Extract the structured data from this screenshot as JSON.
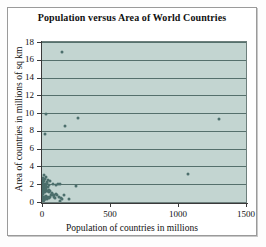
{
  "chart_data": {
    "type": "scatter",
    "title": "Population versus Area of World Countries",
    "xlabel": "Population of countries in millions",
    "ylabel": "Area of countries in millions of sq km",
    "xlim": [
      0,
      1500
    ],
    "ylim": [
      0,
      18
    ],
    "xticks": [
      0,
      500,
      1000,
      1500
    ],
    "yticks": [
      0,
      2,
      4,
      6,
      8,
      10,
      12,
      14,
      16,
      18
    ],
    "xtick_labels": [
      "0",
      "500",
      "1000",
      "1500"
    ],
    "ytick_labels": [
      "0",
      "2",
      "4",
      "6",
      "8",
      "10",
      "12",
      "14",
      "16",
      "18"
    ],
    "grid": "horizontal",
    "legend": "none",
    "marker_color": "#4c6f6c",
    "plot_background": "#c3d5d1",
    "gridline_color": "#55706c",
    "points": [
      {
        "x": 147,
        "y": 16.9
      },
      {
        "x": 30,
        "y": 9.95
      },
      {
        "x": 1300,
        "y": 9.35
      },
      {
        "x": 268,
        "y": 9.5
      },
      {
        "x": 170,
        "y": 8.5
      },
      {
        "x": 22,
        "y": 7.6
      },
      {
        "x": 1070,
        "y": 3.1
      },
      {
        "x": 250,
        "y": 1.8
      },
      {
        "x": 120,
        "y": 2.0
      },
      {
        "x": 100,
        "y": 1.96
      },
      {
        "x": 60,
        "y": 2.4
      },
      {
        "x": 42,
        "y": 2.5
      },
      {
        "x": 35,
        "y": 2.3
      },
      {
        "x": 28,
        "y": 2.8
      },
      {
        "x": 20,
        "y": 2.6
      },
      {
        "x": 16,
        "y": 2.38
      },
      {
        "x": 12,
        "y": 3.0
      },
      {
        "x": 10,
        "y": 2.1
      },
      {
        "x": 8,
        "y": 2.0
      },
      {
        "x": 6,
        "y": 1.9
      },
      {
        "x": 5,
        "y": 2.5
      },
      {
        "x": 4,
        "y": 2.7
      },
      {
        "x": 3,
        "y": 2.2
      },
      {
        "x": 2,
        "y": 1.8
      },
      {
        "x": 14,
        "y": 1.6
      },
      {
        "x": 18,
        "y": 1.5
      },
      {
        "x": 24,
        "y": 1.4
      },
      {
        "x": 30,
        "y": 1.3
      },
      {
        "x": 38,
        "y": 1.25
      },
      {
        "x": 45,
        "y": 1.27
      },
      {
        "x": 55,
        "y": 1.1
      },
      {
        "x": 64,
        "y": 0.8
      },
      {
        "x": 70,
        "y": 0.9
      },
      {
        "x": 80,
        "y": 0.8
      },
      {
        "x": 90,
        "y": 0.75
      },
      {
        "x": 105,
        "y": 0.9
      },
      {
        "x": 113,
        "y": 0.8
      },
      {
        "x": 125,
        "y": 0.6
      },
      {
        "x": 140,
        "y": 0.45
      },
      {
        "x": 150,
        "y": 0.33
      },
      {
        "x": 58,
        "y": 0.55
      },
      {
        "x": 50,
        "y": 0.45
      },
      {
        "x": 44,
        "y": 0.6
      },
      {
        "x": 40,
        "y": 0.35
      },
      {
        "x": 36,
        "y": 0.5
      },
      {
        "x": 32,
        "y": 0.65
      },
      {
        "x": 28,
        "y": 0.45
      },
      {
        "x": 25,
        "y": 0.3
      },
      {
        "x": 22,
        "y": 0.6
      },
      {
        "x": 20,
        "y": 0.4
      },
      {
        "x": 18,
        "y": 0.25
      },
      {
        "x": 16,
        "y": 0.55
      },
      {
        "x": 14,
        "y": 0.35
      },
      {
        "x": 12,
        "y": 0.2
      },
      {
        "x": 11,
        "y": 0.5
      },
      {
        "x": 10,
        "y": 0.3
      },
      {
        "x": 9,
        "y": 0.15
      },
      {
        "x": 8,
        "y": 0.42
      },
      {
        "x": 7,
        "y": 0.25
      },
      {
        "x": 6,
        "y": 0.1
      },
      {
        "x": 5,
        "y": 0.35
      },
      {
        "x": 4,
        "y": 0.18
      },
      {
        "x": 3,
        "y": 0.45
      },
      {
        "x": 2,
        "y": 0.12
      },
      {
        "x": 1,
        "y": 0.3
      },
      {
        "x": 1,
        "y": 0.08
      },
      {
        "x": 2,
        "y": 0.55
      },
      {
        "x": 3,
        "y": 0.75
      },
      {
        "x": 4,
        "y": 0.95
      },
      {
        "x": 5,
        "y": 1.2
      },
      {
        "x": 6,
        "y": 1.45
      },
      {
        "x": 7,
        "y": 1.0
      },
      {
        "x": 8,
        "y": 1.25
      },
      {
        "x": 9,
        "y": 1.6
      },
      {
        "x": 10,
        "y": 1.85
      },
      {
        "x": 11,
        "y": 1.1
      },
      {
        "x": 13,
        "y": 1.35
      },
      {
        "x": 15,
        "y": 1.75
      },
      {
        "x": 17,
        "y": 2.0
      },
      {
        "x": 19,
        "y": 1.15
      },
      {
        "x": 21,
        "y": 1.95
      },
      {
        "x": 23,
        "y": 1.7
      },
      {
        "x": 26,
        "y": 2.05
      },
      {
        "x": 29,
        "y": 1.55
      },
      {
        "x": 33,
        "y": 1.85
      },
      {
        "x": 37,
        "y": 2.1
      },
      {
        "x": 41,
        "y": 1.65
      },
      {
        "x": 48,
        "y": 1.9
      },
      {
        "x": 52,
        "y": 1.35
      },
      {
        "x": 62,
        "y": 1.28
      },
      {
        "x": 75,
        "y": 1.0
      },
      {
        "x": 85,
        "y": 0.6
      },
      {
        "x": 95,
        "y": 0.45
      },
      {
        "x": 130,
        "y": 0.15
      },
      {
        "x": 160,
        "y": 0.8
      },
      {
        "x": 200,
        "y": 0.3
      },
      {
        "x": 130,
        "y": 2.0
      },
      {
        "x": 78,
        "y": 2.0
      }
    ]
  }
}
